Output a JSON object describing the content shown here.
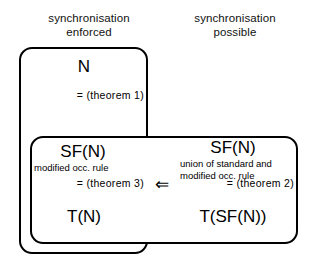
{
  "diagram": {
    "columns": {
      "left_header": "synchronisation\nenforced",
      "right_header": "synchronisation\npossible"
    },
    "boxes": {
      "n_box": {
        "label": "N",
        "relation": "=  (theorem  1)",
        "bottom_label": "T(N)"
      },
      "sf_box": {
        "left": {
          "label": "SF(N)",
          "subtitle": "modified occ. rule",
          "relation": "=  (theorem  3)",
          "bottom_label": "T(N)"
        },
        "right": {
          "label": "SF(N)",
          "subtitle": "union of standard and\nmodified occ. rule",
          "relation": "=  (theorem  2)",
          "bottom_label": "T(SF(N))"
        }
      }
    },
    "connector": {
      "implies_arrow": "⇐",
      "direction": "right-to-left"
    },
    "colors": {
      "stroke": "#000000",
      "background": "#ffffff",
      "text": "#000000"
    }
  }
}
